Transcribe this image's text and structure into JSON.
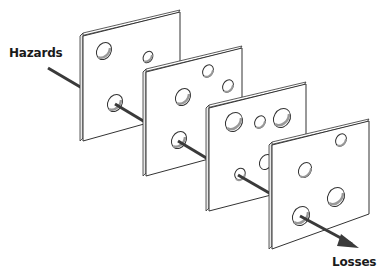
{
  "diagram": {
    "type": "swiss-cheese-model",
    "labels": {
      "input": "Hazards",
      "output": "Losses"
    },
    "colors": {
      "plate_fill": "#ffffff",
      "plate_stroke": "#333333",
      "hole_shadow": "#9a9a9a",
      "arrow": "#3a3a3a",
      "text": "#1a1a1a"
    },
    "plates": [
      {
        "id": 1,
        "holes": 3
      },
      {
        "id": 2,
        "holes": 4
      },
      {
        "id": 3,
        "holes": 5
      },
      {
        "id": 4,
        "holes": 4
      }
    ]
  }
}
